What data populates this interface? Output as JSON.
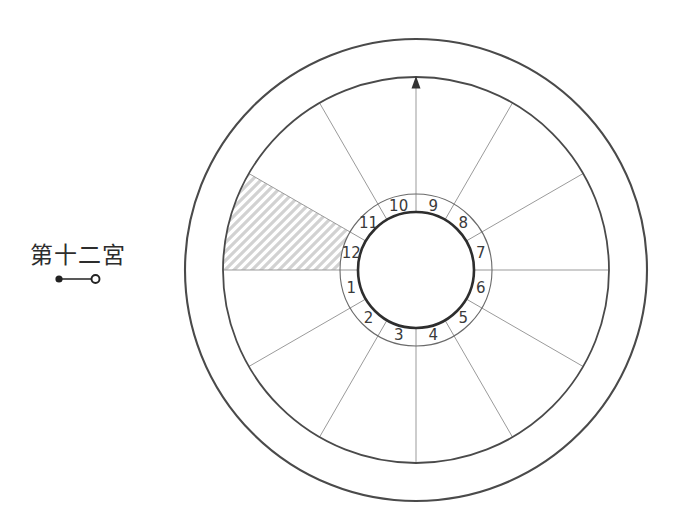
{
  "page": {
    "background": "#ffffff",
    "description_type": "astrology-house-wheel-diagram"
  },
  "annotation": {
    "label": "第十二宮",
    "marker_style": "filled-dot-line-open-circle"
  },
  "chart": {
    "type": "house-wheel",
    "house_count": 12,
    "house_numbers": [
      "1",
      "2",
      "3",
      "4",
      "5",
      "6",
      "7",
      "8",
      "9",
      "10",
      "11",
      "12"
    ],
    "highlighted_house": "12",
    "highlight_style": "diagonal-hatch",
    "arrow_direction": "up",
    "numbering_direction": "counterclockwise",
    "first_house_position": "left-below-horizontal",
    "colors": {
      "line_dark": "#4a4a4a",
      "line_light": "#9b9b9b",
      "tick": "#8a8a8a",
      "number_ring": "#6a6a6a",
      "hub": "#2e2e2e",
      "number_text": "#3a3a3a",
      "hatch": "#d2d2d2",
      "arrow": "#333333",
      "annotation_ink": "#222222"
    }
  }
}
